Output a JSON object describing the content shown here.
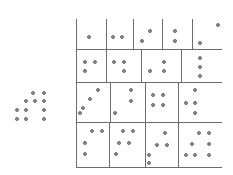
{
  "figure": {
    "title": "",
    "type": "dot-pattern-grid",
    "width": 233,
    "height": 175,
    "background_color": "#ffffff",
    "dot_fill_color": "#8e8e8e",
    "dot_stroke_color": "#6f6f6f",
    "grid_line_color": "#6b6b6b",
    "dot_radius": 2
  },
  "chart_data": {
    "type": "scatter",
    "title": "",
    "xlabel": "",
    "ylabel": "",
    "grid": true,
    "legend": "none",
    "xlim": [
      0,
      233
    ],
    "ylim": [
      0,
      175
    ],
    "grid_lines": {
      "horizontal": [
        {
          "name": "row1-bottom",
          "y": 49,
          "x_start": 76,
          "x_end": 222
        },
        {
          "name": "row2-bottom",
          "y": 82,
          "x_start": 76,
          "x_end": 222
        },
        {
          "name": "row3-bottom",
          "y": 122,
          "x_start": 76,
          "x_end": 222
        },
        {
          "name": "row4-bottom",
          "y": 167,
          "x_start": 76,
          "x_end": 222
        }
      ],
      "vertical": [
        {
          "name": "r1-v0",
          "x": 76,
          "y_start": 19,
          "y_end": 49
        },
        {
          "name": "r1-v1",
          "x": 106,
          "y_start": 19,
          "y_end": 49
        },
        {
          "name": "r1-v2",
          "x": 133,
          "y_start": 19,
          "y_end": 49
        },
        {
          "name": "r1-v3",
          "x": 162,
          "y_start": 19,
          "y_end": 49
        },
        {
          "name": "r1-v4",
          "x": 192,
          "y_start": 19,
          "y_end": 49
        },
        {
          "name": "r2-v0",
          "x": 76,
          "y_start": 49,
          "y_end": 82
        },
        {
          "name": "r2-v1",
          "x": 106,
          "y_start": 49,
          "y_end": 82
        },
        {
          "name": "r2-v2",
          "x": 141,
          "y_start": 49,
          "y_end": 82
        },
        {
          "name": "r2-v3",
          "x": 181,
          "y_start": 49,
          "y_end": 82
        },
        {
          "name": "r3-v0",
          "x": 76,
          "y_start": 82,
          "y_end": 122
        },
        {
          "name": "r3-v1",
          "x": 110,
          "y_start": 82,
          "y_end": 122
        },
        {
          "name": "r3-v2",
          "x": 145,
          "y_start": 82,
          "y_end": 122
        },
        {
          "name": "r3-v3",
          "x": 178,
          "y_start": 82,
          "y_end": 122
        },
        {
          "name": "r4-v0",
          "x": 76,
          "y_start": 122,
          "y_end": 167
        },
        {
          "name": "r4-v1",
          "x": 109,
          "y_start": 122,
          "y_end": 167
        },
        {
          "name": "r4-v2",
          "x": 145,
          "y_start": 122,
          "y_end": 167
        },
        {
          "name": "r4-v3",
          "x": 178,
          "y_start": 122,
          "y_end": 167
        }
      ]
    },
    "cells": [
      {
        "name": "cell-r1c1",
        "row": 1,
        "col": 1,
        "dot_count": 1,
        "dots": [
          [
            89,
            37
          ]
        ]
      },
      {
        "name": "cell-r1c2",
        "row": 1,
        "col": 2,
        "dot_count": 2,
        "dots": [
          [
            113,
            37
          ],
          [
            122,
            37
          ]
        ]
      },
      {
        "name": "cell-r1c3",
        "row": 1,
        "col": 3,
        "dot_count": 2,
        "dots": [
          [
            150,
            31
          ],
          [
            142,
            41
          ]
        ]
      },
      {
        "name": "cell-r1c4",
        "row": 1,
        "col": 4,
        "dot_count": 2,
        "dots": [
          [
            175,
            31
          ],
          [
            175,
            41
          ]
        ]
      },
      {
        "name": "cell-r1c5",
        "row": 1,
        "col": 5,
        "dot_count": 2,
        "dots": [
          [
            218,
            25
          ],
          [
            200,
            43
          ]
        ]
      },
      {
        "name": "cell-r2c1",
        "row": 2,
        "col": 1,
        "dot_count": 3,
        "dots": [
          [
            85,
            62
          ],
          [
            95,
            62
          ],
          [
            85,
            71
          ]
        ]
      },
      {
        "name": "cell-r2c2",
        "row": 2,
        "col": 2,
        "dot_count": 3,
        "dots": [
          [
            114,
            62
          ],
          [
            124,
            62
          ],
          [
            124,
            71
          ]
        ]
      },
      {
        "name": "cell-r2c3",
        "row": 2,
        "col": 3,
        "dot_count": 3,
        "dots": [
          [
            164,
            62
          ],
          [
            150,
            71
          ],
          [
            164,
            71
          ]
        ]
      },
      {
        "name": "cell-r2c4",
        "row": 2,
        "col": 4,
        "dot_count": 3,
        "dots": [
          [
            200,
            58
          ],
          [
            200,
            67
          ],
          [
            200,
            76
          ]
        ]
      },
      {
        "name": "cell-r3c1",
        "row": 3,
        "col": 1,
        "dot_count": 4,
        "dots": [
          [
            98,
            90
          ],
          [
            90,
            99
          ],
          [
            83,
            108
          ],
          [
            80,
            113
          ]
        ]
      },
      {
        "name": "cell-r3c2",
        "row": 3,
        "col": 2,
        "dot_count": 3,
        "dots": [
          [
            131,
            90
          ],
          [
            131,
            101
          ],
          [
            115,
            113
          ]
        ]
      },
      {
        "name": "cell-r3c3",
        "row": 3,
        "col": 3,
        "dot_count": 4,
        "dots": [
          [
            153,
            95
          ],
          [
            163,
            95
          ],
          [
            153,
            105
          ],
          [
            163,
            105
          ]
        ]
      },
      {
        "name": "cell-r3c4",
        "row": 3,
        "col": 4,
        "dot_count": 5,
        "dots": [
          [
            195,
            90
          ],
          [
            186,
            103
          ],
          [
            195,
            103
          ],
          [
            195,
            113
          ]
        ]
      },
      {
        "name": "cell-r4c1",
        "row": 4,
        "col": 1,
        "dot_count": 5,
        "dots": [
          [
            92,
            131
          ],
          [
            102,
            131
          ],
          [
            85,
            143
          ],
          [
            85,
            154
          ]
        ]
      },
      {
        "name": "cell-r4c2",
        "row": 4,
        "col": 2,
        "dot_count": 5,
        "dots": [
          [
            123,
            131
          ],
          [
            133,
            131
          ],
          [
            119,
            143
          ],
          [
            129,
            143
          ],
          [
            116,
            154
          ]
        ]
      },
      {
        "name": "cell-r4c3",
        "row": 4,
        "col": 3,
        "dot_count": 5,
        "dots": [
          [
            165,
            133
          ],
          [
            157,
            145
          ],
          [
            167,
            145
          ],
          [
            149,
            155
          ],
          [
            149,
            163
          ]
        ]
      },
      {
        "name": "cell-r4c4",
        "row": 4,
        "col": 4,
        "dot_count": 6,
        "dots": [
          [
            199,
            133
          ],
          [
            209,
            133
          ],
          [
            192,
            144
          ],
          [
            209,
            144
          ],
          [
            186,
            155
          ],
          [
            195,
            155
          ],
          [
            209,
            155
          ]
        ]
      }
    ],
    "left_group": {
      "name": "left-dot-cluster",
      "dot_count": 10,
      "dots": [
        [
          33,
          93
        ],
        [
          44,
          93
        ],
        [
          26,
          101
        ],
        [
          35,
          101
        ],
        [
          44,
          101
        ],
        [
          17,
          110
        ],
        [
          26,
          110
        ],
        [
          44,
          110
        ],
        [
          17,
          119
        ],
        [
          26,
          119
        ],
        [
          44,
          119
        ]
      ]
    }
  }
}
